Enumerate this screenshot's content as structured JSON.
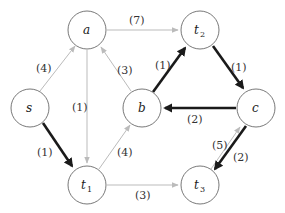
{
  "diagram": {
    "type": "directed-graph",
    "nodes": [
      {
        "id": "a",
        "label": "a",
        "sub": "",
        "x": 87,
        "y": 30
      },
      {
        "id": "t2",
        "label": "t",
        "sub": "2",
        "x": 200,
        "y": 30
      },
      {
        "id": "s",
        "label": "s",
        "sub": "",
        "x": 30,
        "y": 108
      },
      {
        "id": "b",
        "label": "b",
        "sub": "",
        "x": 142,
        "y": 108
      },
      {
        "id": "c",
        "label": "c",
        "sub": "",
        "x": 256,
        "y": 108
      },
      {
        "id": "t1",
        "label": "t",
        "sub": "1",
        "x": 87,
        "y": 185
      },
      {
        "id": "t3",
        "label": "t",
        "sub": "3",
        "x": 200,
        "y": 185
      }
    ],
    "edges": [
      {
        "from": "s",
        "to": "a",
        "weight": "(4)",
        "style": "light"
      },
      {
        "from": "a",
        "to": "t2",
        "weight": "(7)",
        "style": "light"
      },
      {
        "from": "a",
        "to": "t1",
        "weight": "(1)",
        "style": "light"
      },
      {
        "from": "b",
        "to": "a",
        "weight": "(3)",
        "style": "light"
      },
      {
        "from": "b",
        "to": "t2",
        "weight": "(1)",
        "style": "bold"
      },
      {
        "from": "t2",
        "to": "c",
        "weight": "(1)",
        "style": "bold"
      },
      {
        "from": "c",
        "to": "b",
        "weight": "(2)",
        "style": "bold"
      },
      {
        "from": "s",
        "to": "t1",
        "weight": "(1)",
        "style": "bold"
      },
      {
        "from": "t1",
        "to": "b",
        "weight": "(4)",
        "style": "light"
      },
      {
        "from": "t1",
        "to": "t3",
        "weight": "(3)",
        "style": "light"
      },
      {
        "from": "t3",
        "to": "c",
        "weight": "(5)",
        "style": "light"
      },
      {
        "from": "c",
        "to": "t3",
        "weight": "(2)",
        "style": "bold"
      }
    ]
  }
}
